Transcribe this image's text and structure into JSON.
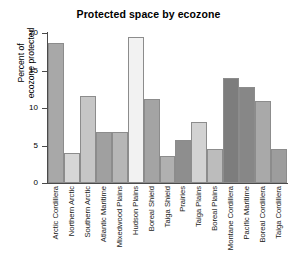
{
  "chart_data": {
    "type": "bar",
    "title": "Protected space by ecozone",
    "xlabel": "",
    "ylabel": "Percent of\necozone protected",
    "ylim": [
      0,
      20
    ],
    "yticks": [
      0,
      5,
      10,
      15,
      20
    ],
    "ytick_labels": [
      "0",
      "5",
      "10",
      "15",
      "20"
    ],
    "grid": false,
    "legend": null,
    "categories": [
      "Arctic Cordillera",
      "Northern Arctic",
      "Southern Arctic",
      "Atlantic Maritime",
      "Mixedwood Plains",
      "Hudson Plains",
      "Boreal Shield",
      "Taiga Shield",
      "Prairies",
      "Taiga Plains",
      "Boreal Plains",
      "Montane Cordillera",
      "Pacific Maritime",
      "Boreal Cordillera",
      "Taiga Cordillera"
    ],
    "values": [
      18.7,
      4.0,
      11.6,
      6.8,
      6.8,
      19.5,
      11.2,
      3.6,
      5.7,
      8.1,
      4.5,
      14.0,
      12.8,
      10.9,
      4.6
    ],
    "bar_colors": [
      "#a8a8a8",
      "#d6d6d6",
      "#c6c6c6",
      "#a0a0a0",
      "#b6b6b6",
      "#f2f2f2",
      "#a4a4a4",
      "#b0b0b0",
      "#8e8e8e",
      "#d2d2d2",
      "#bcbcbc",
      "#7d7d7d",
      "#878787",
      "#a9a9a9",
      "#9d9d9d"
    ],
    "bar_edge_color": "#8c8c8c",
    "axis_color": "#4a4a4a",
    "background": "#ffffff"
  }
}
